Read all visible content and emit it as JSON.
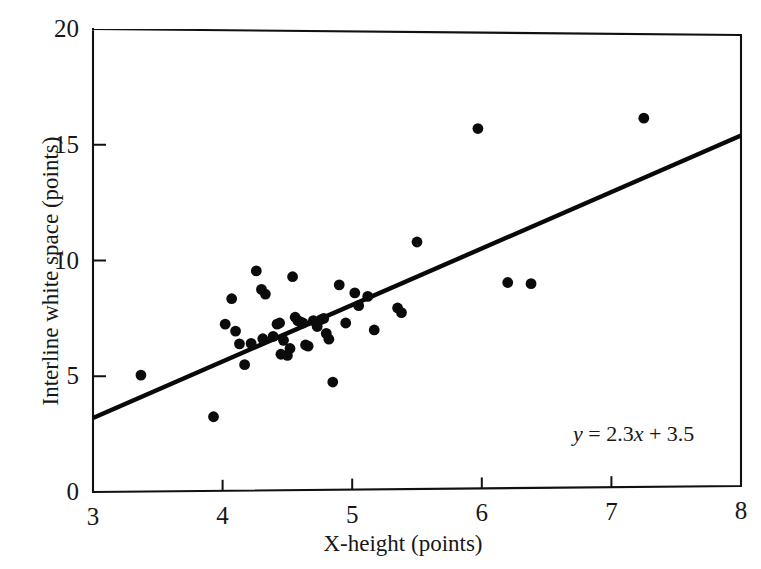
{
  "chart_data": {
    "type": "scatter",
    "title": "",
    "xlabel": "X-height (points)",
    "ylabel": "Interline white space (points)",
    "xlim": [
      3,
      8
    ],
    "ylim": [
      0,
      20
    ],
    "xticks": [
      "3",
      "4",
      "5",
      "6",
      "7",
      "8"
    ],
    "yticks": [
      "0",
      "5",
      "10",
      "15",
      "20"
    ],
    "grid": false,
    "legend": "none",
    "annotation": "y = 2.3x + 3.5",
    "annotation_parts": {
      "y": "y",
      "rest": " = 2.3",
      "x": "x",
      "tail": " + 3.5"
    },
    "trendline": {
      "type": "line",
      "slope": 2.3,
      "intercept": 3.5,
      "x_start": 3.0,
      "y_start": 3.2,
      "x_end": 8.0,
      "y_end": 15.4
    },
    "points": [
      [
        3.37,
        5.05
      ],
      [
        3.93,
        3.25
      ],
      [
        4.02,
        7.25
      ],
      [
        4.07,
        8.35
      ],
      [
        4.1,
        6.95
      ],
      [
        4.13,
        6.4
      ],
      [
        4.17,
        5.5
      ],
      [
        4.22,
        6.42
      ],
      [
        4.26,
        9.55
      ],
      [
        4.3,
        8.75
      ],
      [
        4.31,
        6.62
      ],
      [
        4.33,
        8.55
      ],
      [
        4.39,
        6.72
      ],
      [
        4.42,
        7.25
      ],
      [
        4.44,
        7.3
      ],
      [
        4.45,
        5.95
      ],
      [
        4.47,
        6.55
      ],
      [
        4.5,
        5.9
      ],
      [
        4.52,
        6.2
      ],
      [
        4.54,
        9.3
      ],
      [
        4.56,
        7.55
      ],
      [
        4.58,
        7.4
      ],
      [
        4.6,
        7.35
      ],
      [
        4.62,
        7.3
      ],
      [
        4.64,
        6.35
      ],
      [
        4.66,
        6.3
      ],
      [
        4.7,
        7.4
      ],
      [
        4.73,
        7.15
      ],
      [
        4.76,
        7.45
      ],
      [
        4.78,
        7.5
      ],
      [
        4.8,
        6.85
      ],
      [
        4.82,
        6.6
      ],
      [
        4.85,
        4.75
      ],
      [
        4.9,
        8.95
      ],
      [
        4.95,
        7.3
      ],
      [
        5.02,
        8.6
      ],
      [
        5.05,
        8.05
      ],
      [
        5.12,
        8.45
      ],
      [
        5.17,
        7.0
      ],
      [
        5.35,
        7.95
      ],
      [
        5.38,
        7.75
      ],
      [
        5.5,
        10.8
      ],
      [
        5.97,
        15.7
      ],
      [
        6.2,
        9.05
      ],
      [
        6.38,
        9.0
      ],
      [
        7.25,
        16.15
      ]
    ]
  },
  "axes": {
    "left_px": 93,
    "right_px": 741,
    "top_px": 29,
    "bottom_px": 492
  }
}
